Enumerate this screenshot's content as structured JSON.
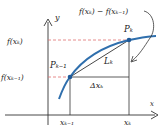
{
  "figure": {
    "colors": {
      "curve": "#2f6fad",
      "axes": "#333333",
      "guide_dashed": "#e07070",
      "point": "#1f5a99",
      "text": "#222222"
    },
    "axes": {
      "x_label": "x",
      "y_label": "y"
    },
    "labels": {
      "f_xk": "f(xₖ)",
      "f_xk_minus_1": "f(xₖ₋₁)",
      "x_k_minus_1": "xₖ₋₁",
      "x_k": "xₖ",
      "P_k": "Pₖ",
      "P_k_minus_1": "Pₖ₋₁",
      "L_k": "Lₖ",
      "delta_x_k": "Δxₖ",
      "difference": "f(xₖ) − f(xₖ₋₁)"
    }
  }
}
